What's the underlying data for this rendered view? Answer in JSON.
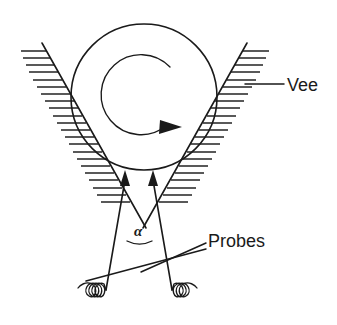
{
  "figure": {
    "background_color": "#ffffff",
    "line_color": "#1a1a1a",
    "width": 337,
    "height": 325
  },
  "labels": {
    "vee": "Vee",
    "probes": "Probes",
    "angle": "α"
  },
  "components": {
    "cylinder": {
      "name": "rotating cylinder",
      "center_x": 144,
      "center_y": 97,
      "radius": 73
    },
    "rotation_arrow": {
      "name": "clockwise rotation arrow",
      "direction": "clockwise",
      "radius": 40
    },
    "vee_left_wall": {
      "name": "left vee wall",
      "x1": 42,
      "y1": 43,
      "x2": 146,
      "y2": 228,
      "hatch_side": "left",
      "hatch_count": 24
    },
    "vee_right_wall": {
      "name": "right vee wall",
      "x1": 247,
      "y1": 43,
      "x2": 143,
      "y2": 228,
      "hatch_side": "right",
      "hatch_count": 24
    },
    "probe_left": {
      "name": "left probe",
      "tip_x": 125,
      "tip_y": 172,
      "base_x": 106,
      "base_y": 290
    },
    "probe_right": {
      "name": "right probe",
      "tip_x": 153,
      "tip_y": 172,
      "base_x": 172,
      "base_y": 290
    },
    "spring_left": {
      "name": "left spring",
      "coils": 4,
      "x_start": 106,
      "x_end": 55,
      "y": 292
    },
    "spring_right": {
      "name": "right spring",
      "coils": 3,
      "x_start": 172,
      "x_end": 226,
      "y": 292
    },
    "angle_arc": {
      "name": "probe included angle arc",
      "vertex_x": 139,
      "vertex_y": 264
    }
  },
  "leaders": {
    "vee_leader": {
      "x1": 245,
      "y1": 84,
      "x2": 284,
      "y2": 84
    },
    "probes_leader_upper": {
      "x1": 141,
      "y1": 272,
      "x2": 206,
      "y2": 243
    },
    "probes_leader_lower": {
      "x1": 86,
      "y1": 281,
      "x2": 206,
      "y2": 249
    }
  }
}
